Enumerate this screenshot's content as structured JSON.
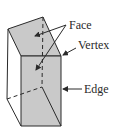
{
  "diagram": {
    "labels": {
      "face": "Face",
      "vertex": "Vertex",
      "edge": "Edge"
    },
    "colors": {
      "face_fill": "#c9c9c9",
      "line": "#2a2a2a",
      "background": "#ffffff"
    }
  }
}
